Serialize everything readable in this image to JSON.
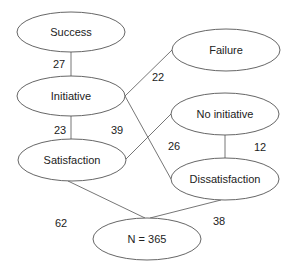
{
  "diagram": {
    "type": "flow-network",
    "nodes": [
      {
        "id": "success",
        "label": "Success",
        "cx": 71,
        "cy": 32,
        "rx": 54,
        "ry": 20
      },
      {
        "id": "initiative",
        "label": "Initiative",
        "cx": 71,
        "cy": 96,
        "rx": 54,
        "ry": 20
      },
      {
        "id": "failure",
        "label": "Failure",
        "cx": 226,
        "cy": 50,
        "rx": 54,
        "ry": 21
      },
      {
        "id": "no_initiative",
        "label": "No initiative",
        "cx": 225,
        "cy": 114,
        "rx": 54,
        "ry": 21
      },
      {
        "id": "satisfaction",
        "label": "Satisfaction",
        "cx": 72,
        "cy": 160,
        "rx": 54,
        "ry": 21
      },
      {
        "id": "dissatisfaction",
        "label": "Dissatisfaction",
        "cx": 225,
        "cy": 179,
        "rx": 54,
        "ry": 21
      },
      {
        "id": "n_total",
        "label": "N = 365",
        "cx": 147,
        "cy": 239,
        "rx": 54,
        "ry": 21
      }
    ],
    "edges": [
      {
        "from": "success",
        "to": "initiative",
        "value": "27",
        "x1": 71,
        "y1": 52,
        "x2": 71,
        "y2": 76,
        "lx": 53,
        "ly": 68
      },
      {
        "from": "initiative",
        "to": "failure",
        "value": "22",
        "x1": 125,
        "y1": 96,
        "x2": 172,
        "y2": 50,
        "lx": 152,
        "ly": 81
      },
      {
        "from": "initiative",
        "to": "dissatisfaction",
        "value": "26",
        "x1": 125,
        "y1": 96,
        "x2": 171,
        "y2": 179,
        "lx": 168,
        "ly": 150
      },
      {
        "from": "initiative",
        "to": "satisfaction",
        "value": "23",
        "x1": 71,
        "y1": 116,
        "x2": 71,
        "y2": 139,
        "lx": 54,
        "ly": 134
      },
      {
        "from": "satisfaction",
        "to": "no_initiative",
        "value": "39",
        "x1": 126,
        "y1": 159,
        "x2": 171,
        "y2": 114,
        "lx": 111,
        "ly": 134
      },
      {
        "from": "no_initiative",
        "to": "dissatisfaction",
        "value": "12",
        "x1": 225,
        "y1": 135,
        "x2": 225,
        "y2": 158,
        "lx": 254,
        "ly": 151
      },
      {
        "from": "satisfaction",
        "to": "n_total",
        "value": "62",
        "x1": 68,
        "y1": 181,
        "x2": 145,
        "y2": 218,
        "lx": 55,
        "ly": 227
      },
      {
        "from": "dissatisfaction",
        "to": "n_total",
        "value": "38",
        "x1": 221,
        "y1": 200,
        "x2": 150,
        "y2": 218,
        "lx": 213,
        "ly": 225
      }
    ]
  }
}
